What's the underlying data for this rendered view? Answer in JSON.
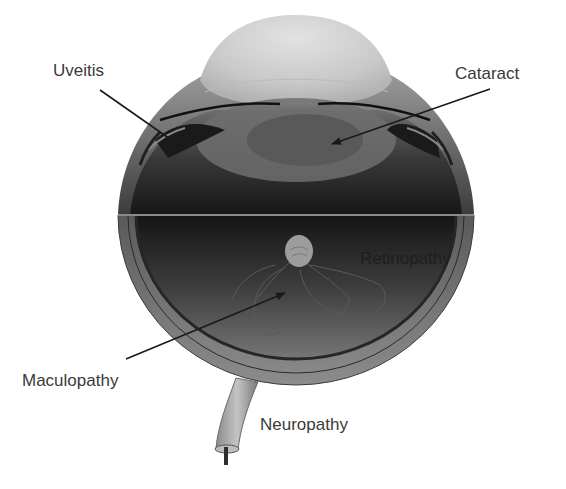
{
  "diagram": {
    "labels": [
      {
        "id": "uveitis",
        "text": "Uveitis",
        "x": 53,
        "y": 62
      },
      {
        "id": "cataract",
        "text": "Cataract",
        "x": 455,
        "y": 65
      },
      {
        "id": "retinopathy",
        "text": "Retinopathy",
        "x": 360,
        "y": 250
      },
      {
        "id": "maculopathy",
        "text": "Maculopathy",
        "x": 22,
        "y": 372
      },
      {
        "id": "neuropathy",
        "text": "Neuropathy",
        "x": 260,
        "y": 416
      }
    ],
    "colors": {
      "background": "#ffffff",
      "label_text": "#3a3a3a",
      "arrow": "#1a1a1a",
      "cornea": "#cfcfcf",
      "lens": "#6a6a6a",
      "interior_dark": "#1c1c1c",
      "sclera": "#8a8a8a",
      "optic_disc": "#9a9a9a"
    }
  }
}
